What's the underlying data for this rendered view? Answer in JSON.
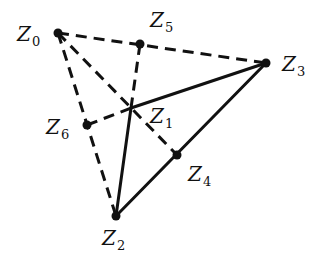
{
  "diagram": {
    "type": "geometric-graph",
    "colors": {
      "line": "#111111",
      "background": "#ffffff"
    },
    "nodes": [
      {
        "id": "Z0",
        "letter": "Z",
        "sub": "0",
        "x": 58,
        "y": 33,
        "dot": true,
        "label_x": 17,
        "label_y": 24
      },
      {
        "id": "Z1",
        "letter": "Z",
        "sub": "1",
        "x": 131,
        "y": 108,
        "dot": false,
        "label_x": 150,
        "label_y": 106
      },
      {
        "id": "Z2",
        "letter": "Z",
        "sub": "2",
        "x": 116,
        "y": 216,
        "dot": true,
        "label_x": 102,
        "label_y": 228
      },
      {
        "id": "Z3",
        "letter": "Z",
        "sub": "3",
        "x": 266,
        "y": 63,
        "dot": true,
        "label_x": 282,
        "label_y": 54
      },
      {
        "id": "Z4",
        "letter": "Z",
        "sub": "4",
        "x": 177,
        "y": 155,
        "dot": true,
        "label_x": 188,
        "label_y": 164
      },
      {
        "id": "Z5",
        "letter": "Z",
        "sub": "5",
        "x": 140,
        "y": 44,
        "dot": true,
        "label_x": 150,
        "label_y": 10
      },
      {
        "id": "Z6",
        "letter": "Z",
        "sub": "6",
        "x": 87,
        "y": 125,
        "dot": true,
        "label_x": 46,
        "label_y": 117
      }
    ],
    "edges": [
      {
        "from": "Z1",
        "to": "Z3",
        "style": "solid"
      },
      {
        "from": "Z1",
        "to": "Z2",
        "style": "solid"
      },
      {
        "from": "Z2",
        "to": "Z3",
        "style": "solid"
      },
      {
        "from": "Z0",
        "to": "Z3",
        "style": "dashed"
      },
      {
        "from": "Z0",
        "to": "Z2",
        "style": "dashed"
      },
      {
        "from": "Z0",
        "to": "Z4",
        "style": "dashed"
      },
      {
        "from": "Z5",
        "to": "Z1",
        "style": "dashed"
      },
      {
        "from": "Z6",
        "to": "Z1",
        "style": "dashed"
      }
    ]
  }
}
